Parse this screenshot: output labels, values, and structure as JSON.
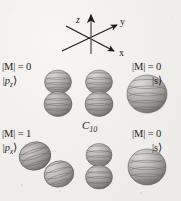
{
  "figure": {
    "name": "C10 molecular orbital isosurface diagram",
    "background_color": "#f2f1ee",
    "ink_color": "#1c1c1c",
    "center_label": "C",
    "center_label_sub": "10"
  },
  "axes": {
    "name": "coordinate-axes-triad",
    "z_label": "z",
    "y_label": "y",
    "x_label": "x",
    "origin": [
      91,
      40
    ],
    "z_tip": [
      91,
      12
    ],
    "y_tip": [
      120,
      23
    ],
    "x_tip": [
      117,
      54
    ],
    "z_tail": [
      91,
      54
    ],
    "y_tail": [
      62,
      51
    ],
    "x_tail": [
      66,
      26
    ]
  },
  "orbitals": [
    {
      "id": "top-left",
      "name": "orbital-pz-left",
      "m_label": "|M| = 0",
      "state_label": "|p",
      "state_sub": "z",
      "state_ket": "⟩",
      "shape": "double-lobe-vertical",
      "cx": 58,
      "cy": 93
    },
    {
      "id": "top-center",
      "name": "orbital-pz-center",
      "m_label": "",
      "state_label": "",
      "state_sub": "",
      "state_ket": "",
      "shape": "double-lobe-vertical",
      "cx": 99,
      "cy": 93
    },
    {
      "id": "top-right",
      "name": "orbital-s-right",
      "m_label": "|M| = 0",
      "state_label": "|s",
      "state_sub": "",
      "state_ket": "⟩",
      "shape": "sphere",
      "cx": 147,
      "cy": 94
    },
    {
      "id": "bottom-left",
      "name": "orbital-px-left",
      "m_label": "|M| = 1",
      "state_label": "|p",
      "state_sub": "x",
      "state_ket": "⟩",
      "shape": "double-lobe-diagonal",
      "cx": 44,
      "cy": 165
    },
    {
      "id": "bottom-center",
      "name": "orbital-pz-center-lower",
      "m_label": "",
      "state_label": "",
      "state_sub": "",
      "state_ket": "",
      "shape": "double-lobe-vertical",
      "cx": 99,
      "cy": 166
    },
    {
      "id": "bottom-right",
      "name": "orbital-s-right-lower",
      "m_label": "|M| = 0",
      "state_label": "|s",
      "state_sub": "",
      "state_ket": "⟩",
      "shape": "sphere",
      "cx": 147,
      "cy": 167
    }
  ],
  "labels": {
    "top_left_m": "|M| = 0",
    "top_left_state_pre": "|p",
    "top_left_state_sub": "z",
    "top_left_state_post": "⟩",
    "top_right_m": "|M| = 0",
    "top_right_state": "|s⟩",
    "bottom_left_m": "|M| = 1",
    "bottom_left_state_pre": "|p",
    "bottom_left_state_sub": "x",
    "bottom_left_state_post": "⟩",
    "bottom_right_m": "|M| = 0",
    "bottom_right_state": "|s⟩"
  }
}
